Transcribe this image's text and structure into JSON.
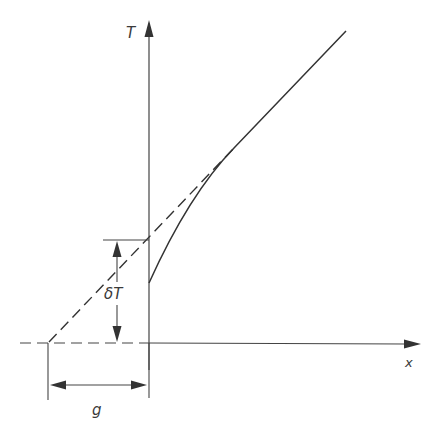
{
  "diagram": {
    "type": "temperature-jump diagram",
    "axes": {
      "vertical_label": "T",
      "horizontal_label": "x"
    },
    "labels": {
      "temperature_jump": "δT",
      "jump_distance": "g"
    },
    "elements": [
      {
        "id": "true-profile",
        "style": "solid curve",
        "description": "actual temperature profile, starts at wall with offset and curves asymptotically to the linear extrapolation"
      },
      {
        "id": "linear-extrapolation",
        "style": "dashed line",
        "description": "linear extrapolation of bulk profile, crosses x-axis a distance g behind the wall"
      },
      {
        "id": "temperature-jump-dimension",
        "style": "double arrow",
        "label": "δT"
      },
      {
        "id": "jump-distance-dimension",
        "style": "double arrow",
        "label": "g"
      }
    ],
    "colors": {
      "ink": "#333333",
      "background": "#ffffff"
    }
  }
}
